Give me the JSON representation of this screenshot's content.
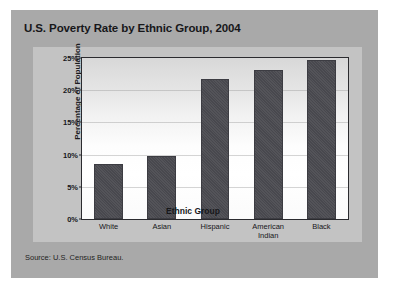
{
  "card": {
    "title": "U.S. Poverty Rate by Ethnic Group, 2004",
    "source": "Source: U.S. Census Bureau."
  },
  "chart_data": {
    "type": "bar",
    "title": "U.S. Poverty Rate by Ethnic Group, 2004",
    "xlabel": "Ethnic Group",
    "ylabel": "Percentage of Population",
    "categories": [
      "White",
      "Asian",
      "Hispanic",
      "American\nIndian",
      "Black"
    ],
    "values": [
      8.6,
      9.8,
      21.8,
      23.1,
      24.7
    ],
    "ylim": [
      0,
      25
    ],
    "yticks": [
      0,
      5,
      10,
      15,
      20,
      25
    ],
    "ytick_labels": [
      "0%",
      "5%",
      "10%",
      "15%",
      "20%",
      "25%"
    ],
    "grid": true,
    "legend": "none",
    "bar_color": "#4c4c52",
    "source": "Source: U.S. Census Bureau."
  }
}
